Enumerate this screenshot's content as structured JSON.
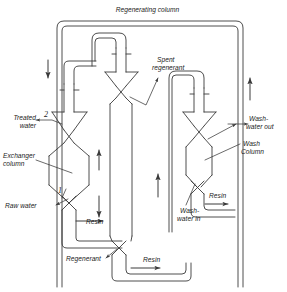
{
  "figure": {
    "kind": "process-flow-diagram",
    "title": "Regenerating column",
    "line_color": "#3a3a3a",
    "text_color": "#1a1a1a",
    "background": "#ffffff"
  },
  "labels": {
    "regenerating_column": "Regenerating column",
    "spent_regenerant_line1": "Spent",
    "spent_regenerant_line2": "regenerant",
    "treated_water_line1": "Treated",
    "treated_water_line2": "water",
    "exchanger_column_line1": "Exchanger",
    "exchanger_column_line2": "column",
    "raw_water": "Raw water",
    "wash_water_out_line1": "Wash-",
    "wash_water_out_line2": "water out",
    "wash_column_line1": "Wash",
    "wash_column_line2": "Column",
    "wash_water_in_line1": "Wash-",
    "wash_water_in_line2": "water in",
    "resin_left": "Resin",
    "resin_center": "Resin",
    "resin_right": "Resin",
    "regenerant": "Regenerant"
  },
  "callout_numbers": {
    "treated_water": "2",
    "raw_water": "1"
  },
  "streams": [
    {
      "name": "treated-water",
      "label": "Treated water",
      "direction": "out-left",
      "tag": "2"
    },
    {
      "name": "raw-water",
      "label": "Raw water",
      "direction": "in-left",
      "tag": "1"
    },
    {
      "name": "spent-regenerant",
      "label": "Spent regenerant",
      "direction": "out-right"
    },
    {
      "name": "wash-water-out",
      "label": "Wash-water out",
      "direction": "out-right"
    },
    {
      "name": "wash-water-in",
      "label": "Wash-water in",
      "direction": "in-left"
    },
    {
      "name": "regenerant",
      "label": "Regenerant",
      "direction": "in-left"
    }
  ],
  "vessels": [
    {
      "name": "exchanger-column",
      "label": "Exchanger column"
    },
    {
      "name": "regenerating-column",
      "label": "Regenerating column"
    },
    {
      "name": "wash-column",
      "label": "Wash Column"
    }
  ],
  "resin_ducts": [
    {
      "name": "resin-duct-left",
      "label": "Resin",
      "flow": "right"
    },
    {
      "name": "resin-duct-center",
      "label": "Resin",
      "flow": "right"
    },
    {
      "name": "resin-duct-right",
      "label": "Resin",
      "flow": "right"
    }
  ],
  "flow_arrows": [
    {
      "name": "arrow-top-left-down",
      "direction": "down"
    },
    {
      "name": "arrow-exchanger-up",
      "direction": "up"
    },
    {
      "name": "arrow-mid-down",
      "direction": "down"
    },
    {
      "name": "arrow-right-up",
      "direction": "up"
    },
    {
      "name": "arrow-far-right-up",
      "direction": "up"
    },
    {
      "name": "arrow-resin-left",
      "direction": "right"
    },
    {
      "name": "arrow-resin-center",
      "direction": "right"
    },
    {
      "name": "arrow-resin-right",
      "direction": "right"
    }
  ]
}
